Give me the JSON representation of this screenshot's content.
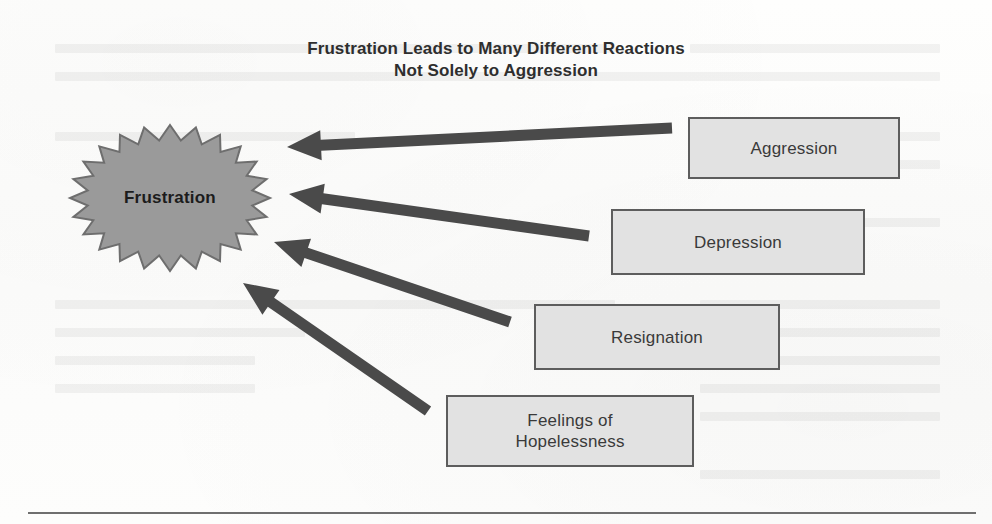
{
  "figure": {
    "title_line1": "Frustration Leads to Many Different Reactions",
    "title_line2": "Not Solely to Aggression",
    "central_node": {
      "label": "Frustration",
      "shape": "starburst",
      "fill_color": "#9a9a9a",
      "stroke_color": "#6e6e6e",
      "text_color": "#1c1c1c",
      "points": 24,
      "center_x": 170,
      "center_y": 198,
      "outer_radius_x": 100,
      "outer_radius_y": 73,
      "inner_radius_x": 83,
      "inner_radius_y": 58
    },
    "reactions": [
      {
        "label": "Aggression",
        "label_line2": "",
        "x": 688,
        "y": 117,
        "width": 212,
        "height": 62,
        "fill_color": "#e2e2e2",
        "border_color": "#5d5d5d"
      },
      {
        "label": "Depression",
        "label_line2": "",
        "x": 611,
        "y": 209,
        "width": 254,
        "height": 66,
        "fill_color": "#e2e2e2",
        "border_color": "#5d5d5d"
      },
      {
        "label": "Resignation",
        "label_line2": "",
        "x": 534,
        "y": 304,
        "width": 246,
        "height": 66,
        "fill_color": "#e2e2e2",
        "border_color": "#5d5d5d"
      },
      {
        "label": "Feelings of",
        "label_line2": "Hopelessness",
        "x": 446,
        "y": 395,
        "width": 248,
        "height": 72,
        "fill_color": "#e2e2e2",
        "border_color": "#5d5d5d"
      }
    ],
    "arrows": [
      {
        "name": "arrow-aggression",
        "from_x": 672,
        "from_y": 128,
        "to_x": 287,
        "to_y": 147,
        "color": "#4a4a4a",
        "shaft_width": 11,
        "head_length": 34,
        "head_width": 30
      },
      {
        "name": "arrow-depression",
        "from_x": 589,
        "from_y": 236,
        "to_x": 289,
        "to_y": 194,
        "color": "#4a4a4a",
        "shaft_width": 11,
        "head_length": 34,
        "head_width": 30
      },
      {
        "name": "arrow-resignation",
        "from_x": 510,
        "from_y": 322,
        "to_x": 274,
        "to_y": 242,
        "color": "#4a4a4a",
        "shaft_width": 11,
        "head_length": 34,
        "head_width": 30
      },
      {
        "name": "arrow-hopelessness",
        "from_x": 428,
        "from_y": 411,
        "to_x": 243,
        "to_y": 283,
        "color": "#4a4a4a",
        "shaft_width": 11,
        "head_length": 34,
        "head_width": 30
      }
    ],
    "bottom_rule": {
      "color": "#6f6f6f",
      "x": 28,
      "y": 512,
      "width": 948
    },
    "background_color": "#fdfdfc"
  }
}
